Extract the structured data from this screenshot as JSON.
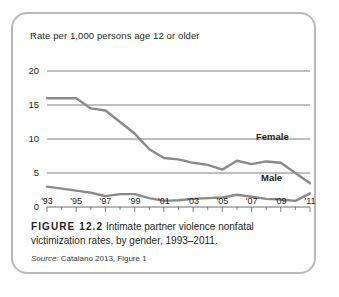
{
  "figure": {
    "number_label": "FIGURE 12.2",
    "caption": "Intimate partner violence nonfatal victimization rates, by gender, 1993–2011.",
    "source_prefix": "Source:",
    "source_text": "Catalano 2013, Figure 1"
  },
  "chart_data": {
    "type": "line",
    "title": "Rate per 1,000 persons age 12 or older",
    "xlabel": "",
    "ylabel": "Rate per 1,000 persons age 12 or older",
    "ylim": [
      0,
      20
    ],
    "xlim": [
      1993,
      2011
    ],
    "yticks": [
      0,
      5,
      10,
      15,
      20
    ],
    "ytick_labels": [
      "0",
      "5",
      "10",
      "15",
      "20"
    ],
    "grid": true,
    "grid_axis": "y",
    "legend_position": "inline-right",
    "line_color": "#8a8a8a",
    "x": [
      1993,
      1994,
      1995,
      1996,
      1997,
      1998,
      1999,
      2000,
      2001,
      2002,
      2003,
      2004,
      2005,
      2006,
      2007,
      2008,
      2009,
      2010,
      2011
    ],
    "xtick_labels": [
      "'93",
      "'95",
      "'97",
      "'99",
      "'01",
      "'03",
      "'05",
      "'07",
      "'09",
      "'11"
    ],
    "xtick_values": [
      1993,
      1995,
      1997,
      1999,
      2001,
      2003,
      2005,
      2007,
      2009,
      2011
    ],
    "series": [
      {
        "name": "Female",
        "values": [
          16.0,
          16.0,
          16.0,
          14.5,
          14.2,
          12.5,
          10.8,
          8.5,
          7.2,
          7.0,
          6.5,
          6.2,
          5.5,
          6.8,
          6.3,
          6.7,
          6.5,
          5.0,
          3.5
        ]
      },
      {
        "name": "Male",
        "values": [
          3.0,
          2.7,
          2.4,
          2.1,
          1.6,
          1.9,
          1.9,
          1.3,
          0.9,
          1.0,
          1.2,
          1.3,
          1.4,
          1.8,
          1.5,
          1.2,
          1.1,
          0.9,
          2.0
        ]
      }
    ]
  }
}
